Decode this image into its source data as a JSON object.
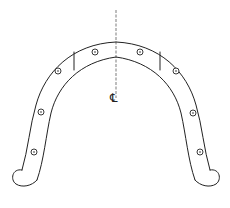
{
  "diagram": {
    "centerline_symbol": "℄",
    "hole_count": 8,
    "segment_dividers": 2,
    "colors": {
      "line": "#222222",
      "background": "#ffffff"
    }
  }
}
